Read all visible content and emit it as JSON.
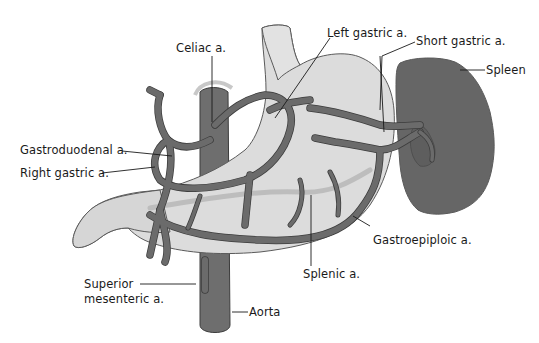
{
  "diagram": {
    "colors": {
      "background": "#ffffff",
      "stomach": "#dcdcdc",
      "spleen": "#666666",
      "aorta": "#6e6e6e",
      "artery": "#6b6b6b",
      "label_text": "#1a1a1a"
    },
    "labels": {
      "celiac": "Celiac a.",
      "left_gastric": "Left gastric a.",
      "short_gastric": "Short gastric a.",
      "spleen": "Spleen",
      "gastroduodenal": "Gastroduodenal a.",
      "right_gastric": "Right gastric a.",
      "gastroepiploic": "Gastroepiploic a.",
      "splenic": "Splenic a.",
      "superior_mesenteric_line1": "Superior",
      "superior_mesenteric_line2": "mesenteric a.",
      "aorta": "Aorta"
    },
    "structures": [
      "stomach",
      "duodenum",
      "esophagus",
      "spleen",
      "aorta",
      "celiac trunk",
      "arterial branches"
    ]
  }
}
